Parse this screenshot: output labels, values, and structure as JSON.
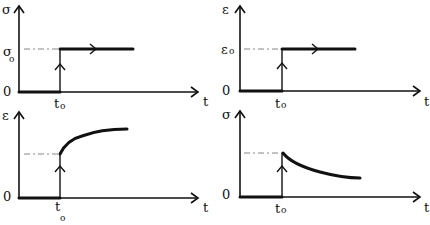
{
  "figure": {
    "colors": {
      "ink": "#111111",
      "dash": "#888888",
      "background": "#ffffff"
    },
    "panels": [
      {
        "id": "stress-input",
        "position": "top-left",
        "y_label": "σ",
        "x_label": "t",
        "level_label": "σ",
        "level_sub": "o",
        "origin_label": "0",
        "time_label": "t",
        "time_sub": "o",
        "curve": "step"
      },
      {
        "id": "strain-input",
        "position": "top-right",
        "y_label": "ε",
        "x_label": "t",
        "level_label": "ε",
        "level_sub": "o",
        "origin_label": "0",
        "time_label": "t",
        "time_sub": "o",
        "curve": "step"
      },
      {
        "id": "creep-response",
        "position": "bottom-left",
        "y_label": "ε",
        "x_label": "t",
        "origin_label": "0",
        "time_label": "t",
        "time_sub": "o",
        "curve": "creep (rising, saturating)"
      },
      {
        "id": "relaxation-response",
        "position": "bottom-right",
        "y_label": "σ",
        "x_label": "t",
        "origin_label": "0",
        "time_label": "t",
        "time_sub": "o",
        "curve": "relaxation (decaying)"
      }
    ]
  }
}
